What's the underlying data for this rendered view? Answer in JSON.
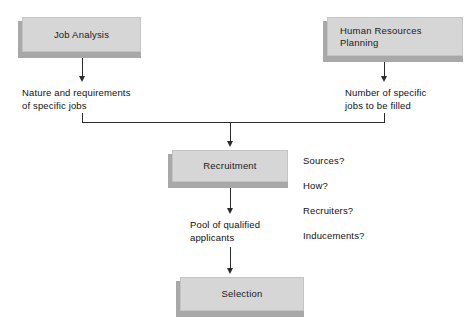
{
  "diagram": {
    "colors": {
      "box_fill": "#d6d6d6",
      "box_border": "#c4c4c4",
      "box_shadow": "#a8a8a8",
      "line": "#2b2b2b",
      "text": "#111111",
      "background": "#ffffff"
    },
    "boxes": [
      {
        "id": "job-analysis",
        "label": "Job Analysis",
        "align": "center"
      },
      {
        "id": "hr-planning",
        "label": "Human Resources\nPlanning",
        "align": "left"
      },
      {
        "id": "recruitment",
        "label": "Recruitment",
        "align": "center"
      },
      {
        "id": "selection",
        "label": "Selection",
        "align": "center"
      }
    ],
    "notes": [
      {
        "id": "job-analysis-output",
        "text": "Nature and requirements\nof specific jobs"
      },
      {
        "id": "hr-planning-output",
        "text": "Number of specific\njobs to be filled"
      },
      {
        "id": "recruitment-output",
        "text": "Pool of qualified\napplicants"
      }
    ],
    "questions": {
      "id": "recruitment-questions",
      "items": [
        "Sources?",
        "How?",
        "Recruiters?",
        "Inducements?"
      ]
    }
  }
}
